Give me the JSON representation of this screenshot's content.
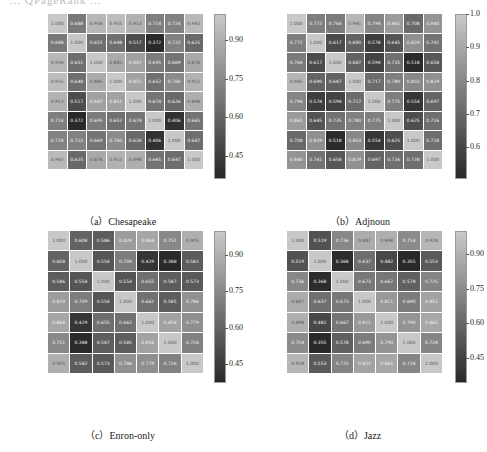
{
  "page": {
    "top_text": "... QPageRank ..."
  },
  "chart_data": [
    {
      "type": "heatmap",
      "title": "(a) Chesapeake",
      "caption": "（a）Chesapeake",
      "rows": [
        "DC",
        "BC",
        "CC",
        "PageRank",
        "LTC",
        "k-shell",
        "QPageRank",
        "三度衰减 Grover 行走算法"
      ],
      "cols": [
        "DC",
        "BC",
        "CC",
        "PageRank",
        "LTC",
        "k-shell",
        "QPageRank",
        "三度衰减 Grover行走算法"
      ],
      "values": [
        [
          1.0,
          0.688,
          0.934,
          0.955,
          0.913,
          0.714,
          0.724,
          0.942
        ],
        [
          0.688,
          1.0,
          0.651,
          0.648,
          0.517,
          0.372,
          0.722,
          0.625
        ],
        [
          0.934,
          0.651,
          1.0,
          0.885,
          0.847,
          0.695,
          0.669,
          0.876
        ],
        [
          0.955,
          0.648,
          0.885,
          1.0,
          0.851,
          0.652,
          0.76,
          0.912
        ],
        [
          0.913,
          0.517,
          0.847,
          0.851,
          1.0,
          0.674,
          0.626,
          0.898
        ],
        [
          0.714,
          0.372,
          0.695,
          0.652,
          0.674,
          1.0,
          0.406,
          0.665
        ],
        [
          0.724,
          0.722,
          0.669,
          0.76,
          0.626,
          0.406,
          1.0,
          0.647
        ],
        [
          0.942,
          0.625,
          0.876,
          0.912,
          0.898,
          0.665,
          0.647,
          1.0
        ]
      ],
      "colorbar": {
        "ticks": [
          "0.90",
          "0.75",
          "0.60",
          "0.45"
        ],
        "range": [
          0.37,
          1.0
        ]
      }
    },
    {
      "type": "heatmap",
      "title": "(b) Adjnoun",
      "caption": "（b）Adjnoun",
      "rows": [
        "DC",
        "BC",
        "CC",
        "PageRank",
        "LTC",
        "k-shell",
        "QPageRank",
        "三度衰减 Grover 行走算法"
      ],
      "cols": [
        "DC",
        "BC",
        "CC",
        "PageRank",
        "LTC",
        "k-shell",
        "QPageRank",
        "三度衰减 Grover行走算法"
      ],
      "values": [
        [
          1.0,
          0.772,
          0.764,
          0.945,
          0.794,
          0.861,
          0.708,
          0.84
        ],
        [
          0.772,
          1.0,
          0.617,
          0.69,
          0.578,
          0.645,
          0.829,
          0.741
        ],
        [
          0.764,
          0.617,
          1.0,
          0.687,
          0.594,
          0.735,
          0.518,
          0.658
        ],
        [
          0.945,
          0.69,
          0.687,
          1.0,
          0.717,
          0.78,
          0.803,
          0.829
        ],
        [
          0.794,
          0.578,
          0.594,
          0.717,
          1.0,
          0.775,
          0.554,
          0.697
        ],
        [
          0.861,
          0.645,
          0.735,
          0.78,
          0.775,
          1.0,
          0.625,
          0.726
        ],
        [
          0.708,
          0.829,
          0.518,
          0.803,
          0.554,
          0.625,
          1.0,
          0.728
        ],
        [
          0.84,
          0.741,
          0.658,
          0.829,
          0.697,
          0.726,
          0.728,
          1.0
        ]
      ],
      "colorbar": {
        "ticks": [
          "1.0",
          "0.9",
          "0.8",
          "0.7",
          "0.6"
        ],
        "range": [
          0.51,
          1.0
        ]
      }
    },
    {
      "type": "heatmap",
      "title": "(c) Enron-only",
      "caption": "（c）Enron-only",
      "rows": [
        "DC",
        "BC",
        "CC",
        "PageRank",
        "LTC",
        "k-shell",
        "三度衰减 Grover 行走算法"
      ],
      "cols": [
        "DC",
        "BC",
        "CC",
        "PageRank",
        "LTC",
        "k-shell",
        "三度衰减 Grover行走算法"
      ],
      "values": [
        [
          1.0,
          0.608,
          0.586,
          0.829,
          0.868,
          0.751,
          0.905
        ],
        [
          0.608,
          1.0,
          0.554,
          0.709,
          0.429,
          0.388,
          0.582
        ],
        [
          0.586,
          0.554,
          1.0,
          0.554,
          0.655,
          0.587,
          0.573
        ],
        [
          0.829,
          0.709,
          0.554,
          1.0,
          0.662,
          0.585,
          0.786
        ],
        [
          0.868,
          0.429,
          0.655,
          0.662,
          1.0,
          0.854,
          0.779
        ],
        [
          0.751,
          0.388,
          0.587,
          0.585,
          0.854,
          1.0,
          0.726
        ],
        [
          0.905,
          0.582,
          0.573,
          0.786,
          0.779,
          0.726,
          1.0
        ]
      ],
      "colorbar": {
        "ticks": [
          "0.90",
          "0.75",
          "0.60",
          "0.45"
        ],
        "range": [
          0.38,
          1.0
        ]
      }
    },
    {
      "type": "heatmap",
      "title": "(d) Jazz",
      "caption": "（d）Jazz",
      "rows": [
        "DC",
        "BC",
        "CC",
        "PageRank",
        "LTC",
        "k-shell",
        "三度衰减 Grover 行走算法"
      ],
      "cols": [
        "DC",
        "BC",
        "CC",
        "PageRank",
        "LTC",
        "k-shell",
        "三度衰减 Grover行走算法"
      ],
      "values": [
        [
          1.0,
          0.519,
          0.736,
          0.887,
          0.898,
          0.754,
          0.928
        ],
        [
          0.519,
          1.0,
          0.368,
          0.637,
          0.482,
          0.355,
          0.553
        ],
        [
          0.736,
          0.368,
          1.0,
          0.673,
          0.667,
          0.578,
          0.725
        ],
        [
          0.887,
          0.637,
          0.673,
          1.0,
          0.811,
          0.69,
          0.851
        ],
        [
          0.898,
          0.482,
          0.667,
          0.811,
          1.0,
          0.79,
          0.865
        ],
        [
          0.754,
          0.355,
          0.578,
          0.69,
          0.79,
          1.0,
          0.728
        ],
        [
          0.928,
          0.553,
          0.725,
          0.851,
          0.865,
          0.728,
          1.0
        ]
      ],
      "colorbar": {
        "ticks": [
          "0.90",
          "0.75",
          "0.60",
          "0.45"
        ],
        "range": [
          0.35,
          1.0
        ]
      }
    }
  ]
}
